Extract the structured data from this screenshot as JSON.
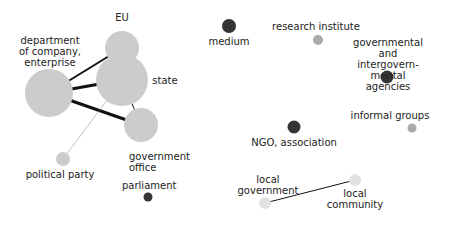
{
  "title": "",
  "colors": {
    "light_node": "#cccccc",
    "mid_node": "#aaaaaa",
    "dark_node": "#353535",
    "faint_node": "#e2e2e2",
    "edge": "#111111",
    "edge_light": "#888888",
    "text": "#222222"
  },
  "nodes": [
    {
      "id": "eu",
      "label": "EU",
      "tone": "light_node",
      "size": 17
    },
    {
      "id": "state",
      "label": "state",
      "tone": "light_node",
      "size": 26
    },
    {
      "id": "department",
      "label": "department\nof company,\nenterprise",
      "tone": "light_node",
      "size": 24
    },
    {
      "id": "government_office",
      "label": "government\noffice",
      "tone": "light_node",
      "size": 17
    },
    {
      "id": "political_party",
      "label": "political party",
      "tone": "light_node",
      "size": 7
    },
    {
      "id": "parliament",
      "label": "parliament",
      "tone": "dark_node",
      "size": 4.5
    },
    {
      "id": "medium",
      "label": "medium",
      "tone": "dark_node",
      "size": 7
    },
    {
      "id": "research_institute",
      "label": "research institute",
      "tone": "mid_node",
      "size": 5
    },
    {
      "id": "gov_agencies",
      "label": "governmental\nand intergovern-\nmental agencies",
      "tone": "dark_node",
      "size": 6.5
    },
    {
      "id": "ngo",
      "label": "NGO, association",
      "tone": "dark_node",
      "size": 6.5
    },
    {
      "id": "informal_groups",
      "label": "informal groups",
      "tone": "mid_node",
      "size": 4.5
    },
    {
      "id": "local_community",
      "label": "local\ncommunity",
      "tone": "faint_node",
      "size": 6
    },
    {
      "id": "local_government",
      "label": "local\ngovernment",
      "tone": "faint_node",
      "size": 6
    }
  ],
  "edges": [
    {
      "source": "department",
      "target": "eu",
      "weight": 2
    },
    {
      "source": "department",
      "target": "state",
      "weight": 3
    },
    {
      "source": "department",
      "target": "government_office",
      "weight": 3
    },
    {
      "source": "state",
      "target": "government_office",
      "weight": 1
    },
    {
      "source": "state",
      "target": "political_party",
      "weight": 0.5
    },
    {
      "source": "local_government",
      "target": "local_community",
      "weight": 1
    }
  ]
}
